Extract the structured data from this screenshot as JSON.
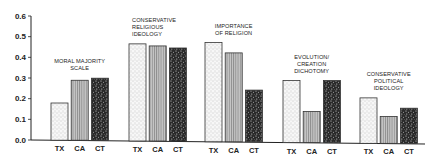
{
  "chart_data": {
    "type": "bar",
    "title": "",
    "xlabel": "",
    "ylabel": "",
    "ylim": [
      0.0,
      0.6
    ],
    "yticks": [
      "0.0",
      "0.1",
      "0.2",
      "0.3",
      "0.4",
      "0.5",
      "0.6"
    ],
    "grid": false,
    "legend": "none",
    "bar_categories": [
      "TX",
      "CA",
      "CT"
    ],
    "groups": [
      {
        "label_lines": [
          "MORAL MAJORITY",
          "SCALE"
        ],
        "values": [
          0.18,
          0.29,
          0.3
        ]
      },
      {
        "label_lines": [
          "CONSERVATIVE",
          "RELIGIOUS",
          "IDEOLOGY"
        ],
        "values": [
          0.47,
          0.46,
          0.45
        ]
      },
      {
        "label_lines": [
          "IMPORTANCE",
          "OF RELIGION"
        ],
        "values": [
          0.48,
          0.43,
          0.25
        ]
      },
      {
        "label_lines": [
          "EVOLUTION/",
          "CREATION",
          "DICHOTOMY"
        ],
        "values": [
          0.3,
          0.15,
          0.3
        ]
      },
      {
        "label_lines": [
          "CONSERVATIVE",
          "POLITICAL",
          "IDEOLOGY"
        ],
        "values": [
          0.22,
          0.13,
          0.17
        ]
      }
    ],
    "series": [
      {
        "name": "TX",
        "pattern": "light-stipple",
        "values": [
          0.18,
          0.47,
          0.48,
          0.3,
          0.22
        ]
      },
      {
        "name": "CA",
        "pattern": "vertical-lines",
        "values": [
          0.29,
          0.46,
          0.43,
          0.15,
          0.13
        ]
      },
      {
        "name": "CT",
        "pattern": "dark-stipple",
        "values": [
          0.3,
          0.45,
          0.25,
          0.3,
          0.17
        ]
      }
    ]
  }
}
